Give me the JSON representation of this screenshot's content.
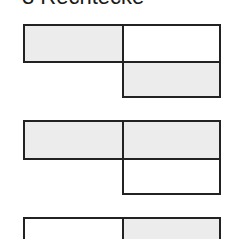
{
  "title": "3 Rechtecke",
  "colors": {
    "fill": "#ececec",
    "empty": "#ffffff",
    "stroke": "#222222"
  },
  "groups": [
    {
      "cells": [
        {
          "pos": "top-left",
          "filled": true
        },
        {
          "pos": "top-right",
          "filled": false
        },
        {
          "pos": "bottom-right",
          "filled": true
        }
      ]
    },
    {
      "cells": [
        {
          "pos": "top-left",
          "filled": true
        },
        {
          "pos": "top-right",
          "filled": true
        },
        {
          "pos": "bottom-right",
          "filled": false
        }
      ]
    },
    {
      "cells": [
        {
          "pos": "top-left",
          "filled": false
        },
        {
          "pos": "top-right",
          "filled": true
        }
      ]
    }
  ]
}
